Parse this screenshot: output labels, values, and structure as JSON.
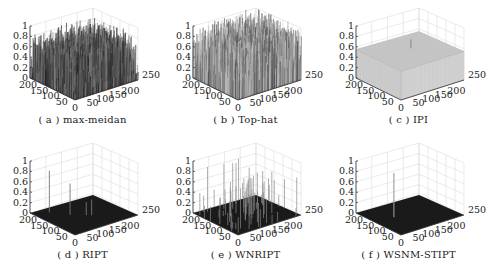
{
  "figure": {
    "panels": [
      {
        "id": "a",
        "label": "( a ) max-meidan",
        "style": "dense-noise-dark"
      },
      {
        "id": "b",
        "label": "( b ) Top-hat",
        "style": "dense-noise-gray"
      },
      {
        "id": "c",
        "label": "( c ) IPI",
        "style": "flat-plateau"
      },
      {
        "id": "d",
        "label": "( d ) RIPT",
        "style": "sparse-spikes"
      },
      {
        "id": "e",
        "label": "( e ) WNRIPT",
        "style": "many-spikes"
      },
      {
        "id": "f",
        "label": "( f ) WSNM-STIPT",
        "style": "single-spike"
      }
    ],
    "axes": {
      "z_ticks": [
        "0",
        "0.2",
        "0.4",
        "0.6",
        "0.8",
        "1"
      ],
      "x_ticks": [
        "0",
        "50",
        "100",
        "150",
        "200",
        "250"
      ],
      "y_ticks": [
        "50",
        "100",
        "150",
        "200"
      ]
    }
  },
  "chart_data": [
    {
      "type": "surface",
      "title": "( a ) max-meidan",
      "zlim": [
        0,
        1
      ],
      "xlim": [
        0,
        250
      ],
      "ylim": [
        0,
        200
      ],
      "description": "dense clutter residue with values spread 0-0.9",
      "grid": true
    },
    {
      "type": "surface",
      "title": "( b ) Top-hat",
      "zlim": [
        0,
        1
      ],
      "xlim": [
        0,
        250
      ],
      "ylim": [
        0,
        200
      ],
      "description": "dense clutter residue with values 0.2-1.0",
      "grid": true
    },
    {
      "type": "surface",
      "title": "( c ) IPI",
      "zlim": [
        0,
        1
      ],
      "xlim": [
        0,
        250
      ],
      "ylim": [
        0,
        200
      ],
      "description": "flat plateau near 0.55 with small target peak ~0.65",
      "grid": true
    },
    {
      "type": "surface",
      "title": "( d ) RIPT",
      "zlim": [
        0,
        1
      ],
      "xlim": [
        0,
        250
      ],
      "ylim": [
        0,
        200
      ],
      "description": "near-zero background with a few spikes up to ~0.8",
      "grid": true
    },
    {
      "type": "surface",
      "title": "( e ) WNRIPT",
      "zlim": [
        0,
        1
      ],
      "xlim": [
        0,
        250
      ],
      "ylim": [
        0,
        200
      ],
      "description": "near-zero background with many spikes up to ~0.9",
      "grid": true
    },
    {
      "type": "surface",
      "title": "( f ) WSNM-STIPT",
      "zlim": [
        0,
        1
      ],
      "xlim": [
        0,
        250
      ],
      "ylim": [
        0,
        200
      ],
      "description": "near-zero background with a single target spike ~0.85",
      "grid": true
    }
  ]
}
